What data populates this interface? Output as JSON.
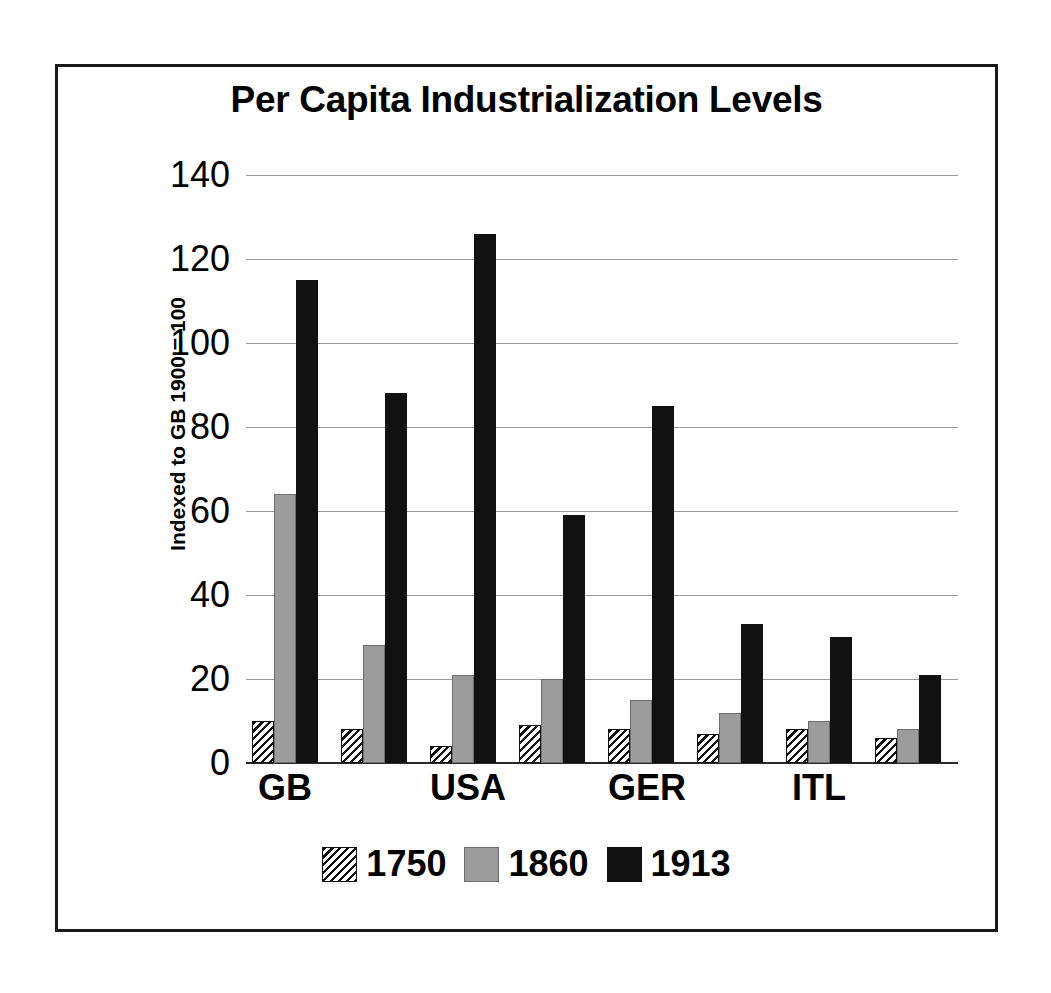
{
  "chart_data": {
    "type": "bar",
    "title": "Per Capita Industrialization Levels",
    "xlabel": "",
    "ylabel": "Indexed to GB 1900 = 100",
    "ylim": [
      0,
      140
    ],
    "ytick_labels": [
      "140",
      "120",
      "100",
      "80",
      "60",
      "40",
      "20",
      "0"
    ],
    "ytick_values": [
      140,
      120,
      100,
      80,
      60,
      40,
      20,
      0
    ],
    "grid": true,
    "legend_position": "bottom",
    "categories": [
      "GB",
      "",
      "USA",
      "",
      "GER",
      "",
      "ITL",
      ""
    ],
    "visible_tick_labels": [
      "GB",
      "USA",
      "GER",
      "ITL"
    ],
    "series": [
      {
        "name": "1750",
        "values": [
          10,
          8,
          4,
          9,
          8,
          7,
          8,
          6
        ]
      },
      {
        "name": "1860",
        "values": [
          64,
          28,
          21,
          20,
          15,
          12,
          10,
          8
        ]
      },
      {
        "name": "1913",
        "values": [
          115,
          88,
          126,
          59,
          85,
          33,
          30,
          21
        ]
      }
    ],
    "series_colors": [
      "#9c9c9c",
      "#9c9c9c",
      "#111111"
    ],
    "series_patterns": [
      "diagonal-hatch",
      "solid-gray",
      "solid-black"
    ]
  },
  "legend": {
    "entries": [
      {
        "label": "1750",
        "swatch": "hatch-swatch-icon"
      },
      {
        "label": "1860",
        "swatch": "gray-swatch-icon"
      },
      {
        "label": "1913",
        "swatch": "black-swatch-icon"
      }
    ]
  }
}
